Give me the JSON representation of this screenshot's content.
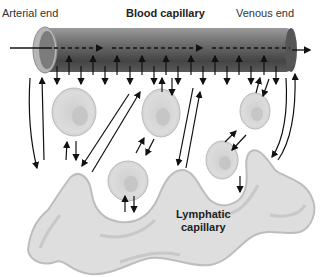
{
  "labels": {
    "arterial_end": "Arterial end",
    "blood_capillary": "Blood capillary",
    "venous_end": "Venous end",
    "lymphatic_capillary_line1": "Lymphatic",
    "lymphatic_capillary_line2": "capillary"
  },
  "colors": {
    "capillary_dark": "#4a4a4a",
    "capillary_light": "#8a8a8a",
    "cell_fill": "#d9d9d9",
    "lymph_fill": "#dedede",
    "arrow": "#111111"
  }
}
